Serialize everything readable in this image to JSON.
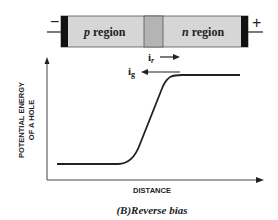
{
  "diode": {
    "negative_terminal": "−",
    "positive_terminal": "+",
    "p_region": {
      "letter": "p",
      "word": " region"
    },
    "n_region": {
      "letter": "n",
      "word": " region"
    },
    "colors": {
      "region_fill": "#d6d6d6",
      "junction_fill": "#b4b4b4",
      "end_cap": "#111111"
    }
  },
  "currents": {
    "recombination": {
      "symbol": "i",
      "subscript": "r",
      "direction": "right"
    },
    "generation": {
      "symbol": "i",
      "subscript": "g",
      "direction": "left"
    }
  },
  "plot": {
    "ylabel_line1": "POTENTIAL ENERGY",
    "ylabel_line2": "OF A HOLE",
    "xlabel": "DISTANCE",
    "curve": "low flat (p side), steep rise through junction, high flat (n side)"
  },
  "caption": "(B)Reverse bias"
}
